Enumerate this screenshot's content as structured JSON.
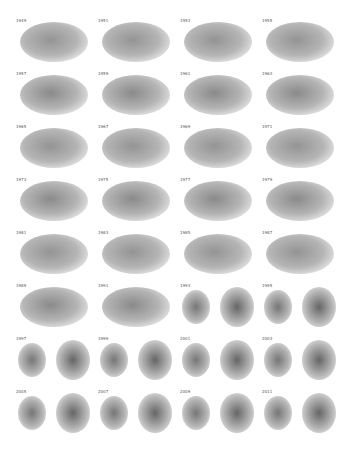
{
  "figure": {
    "panels": [
      {
        "year": "1949",
        "layout": "single"
      },
      {
        "year": "1951",
        "layout": "single"
      },
      {
        "year": "1953",
        "layout": "single"
      },
      {
        "year": "1955",
        "layout": "single"
      },
      {
        "year": "1957",
        "layout": "single"
      },
      {
        "year": "1959",
        "layout": "single"
      },
      {
        "year": "1961",
        "layout": "single"
      },
      {
        "year": "1963",
        "layout": "single"
      },
      {
        "year": "1965",
        "layout": "single"
      },
      {
        "year": "1967",
        "layout": "single"
      },
      {
        "year": "1969",
        "layout": "single"
      },
      {
        "year": "1971",
        "layout": "single"
      },
      {
        "year": "1973",
        "layout": "single"
      },
      {
        "year": "1975",
        "layout": "single"
      },
      {
        "year": "1977",
        "layout": "single"
      },
      {
        "year": "1979",
        "layout": "single"
      },
      {
        "year": "1981",
        "layout": "single"
      },
      {
        "year": "1983",
        "layout": "single"
      },
      {
        "year": "1985",
        "layout": "single"
      },
      {
        "year": "1987",
        "layout": "single"
      },
      {
        "year": "1989",
        "layout": "single"
      },
      {
        "year": "1991",
        "layout": "single"
      },
      {
        "year": "1993",
        "layout": "split"
      },
      {
        "year": "1995",
        "layout": "split"
      },
      {
        "year": "1997",
        "layout": "split"
      },
      {
        "year": "1999",
        "layout": "split"
      },
      {
        "year": "2001",
        "layout": "split"
      },
      {
        "year": "2003",
        "layout": "split"
      },
      {
        "year": "2005",
        "layout": "split"
      },
      {
        "year": "2007",
        "layout": "split"
      },
      {
        "year": "2009",
        "layout": "split"
      },
      {
        "year": "2011",
        "layout": "split"
      }
    ]
  }
}
